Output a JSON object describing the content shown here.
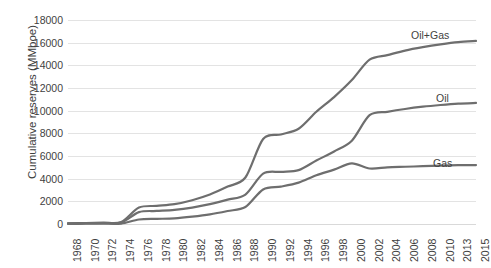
{
  "chart_data": {
    "type": "line",
    "title": "",
    "xlabel": "",
    "ylabel": "Cumulative reserves (MMboe)",
    "ylim": [
      0,
      18000
    ],
    "ytick_values": [
      0,
      2000,
      4000,
      6000,
      8000,
      10000,
      12000,
      14000,
      16000,
      18000
    ],
    "ytick_labels": [
      "0",
      "2000",
      "4000",
      "6000",
      "8000",
      "10000",
      "12000",
      "14000",
      "16000",
      "18000"
    ],
    "grid": true,
    "legend_position": "inline-right-of-series",
    "categories": [
      "1968",
      "1970",
      "1972",
      "1974",
      "1976",
      "1978",
      "1980",
      "1982",
      "1984",
      "1986",
      "1988",
      "1990",
      "1992",
      "1994",
      "1996",
      "1998",
      "2000",
      "2002",
      "2004",
      "2006",
      "2008",
      "2010",
      "2013",
      "2015"
    ],
    "x": [
      1968,
      1970,
      1972,
      1974,
      1976,
      1978,
      1980,
      1982,
      1984,
      1986,
      1988,
      1990,
      1992,
      1994,
      1996,
      1998,
      2000,
      2002,
      2004,
      2006,
      2008,
      2010,
      2013,
      2015
    ],
    "series": [
      {
        "name": "Oil+Gas",
        "color": "#6e6e6e",
        "values": [
          60,
          90,
          120,
          170,
          1450,
          1600,
          1750,
          2100,
          2600,
          3300,
          4100,
          7500,
          7900,
          8400,
          9900,
          11200,
          12700,
          14500,
          14900,
          15300,
          15600,
          15850,
          16050,
          16150
        ]
      },
      {
        "name": "Oil",
        "color": "#6e6e6e",
        "values": [
          50,
          70,
          90,
          130,
          1050,
          1150,
          1250,
          1450,
          1750,
          2150,
          2600,
          4450,
          4600,
          4750,
          5600,
          6400,
          7350,
          9600,
          9900,
          10150,
          10350,
          10500,
          10620,
          10680
        ]
      },
      {
        "name": "Gas",
        "color": "#6e6e6e",
        "values": [
          10,
          20,
          30,
          40,
          400,
          450,
          500,
          650,
          850,
          1150,
          1500,
          3050,
          3300,
          3650,
          4300,
          4800,
          5350,
          4900,
          5000,
          5050,
          5100,
          5150,
          5190,
          5200
        ]
      }
    ],
    "series_labels": [
      {
        "name": "Oil+Gas",
        "x_px": 411,
        "y_px": 29
      },
      {
        "name": "Oil",
        "x_px": 436,
        "y_px": 92
      },
      {
        "name": "Gas",
        "x_px": 433,
        "y_px": 157
      }
    ]
  }
}
